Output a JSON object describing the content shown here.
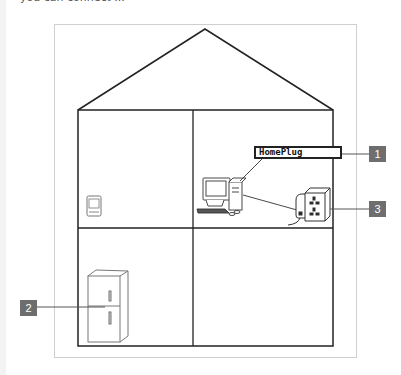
{
  "caption_partial": "you can connect ...",
  "diagram": {
    "device_label": "HomePlug",
    "callouts": [
      {
        "number": "1",
        "target": "HomePlug network label"
      },
      {
        "number": "2",
        "target": "refrigerator"
      },
      {
        "number": "3",
        "target": "HomePlug adapter in wall socket"
      }
    ],
    "rooms": [
      "upper-left",
      "upper-right",
      "lower-left",
      "lower-right"
    ],
    "devices": [
      "wall-panel-display",
      "desktop-computer",
      "homeplug-adapter",
      "wall-socket",
      "refrigerator"
    ]
  },
  "colors": {
    "badge": "#6e6e6e",
    "lines": "#222222",
    "frame": "#cfcfcf"
  }
}
